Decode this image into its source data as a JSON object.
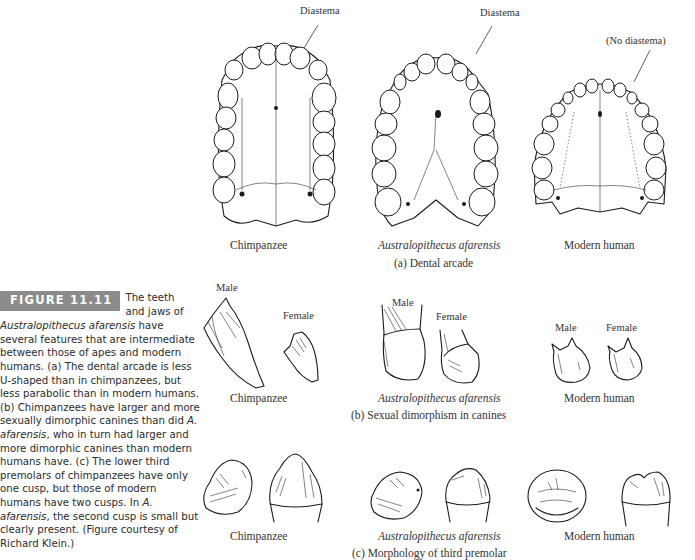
{
  "figure": {
    "badge": "FIGURE 11.11",
    "caption_lead_1": "The teeth",
    "caption_lead_2": "and jaws of",
    "caption_italic_1": "Australopithecus afarensis",
    "caption_text_1": " have several features that are intermediate between those of apes and modern humans. (a) The dental arcade is less U-shaped than in chimpanzees, but less parabolic than in modern humans. (b) Chimpanzees have larger and more sexually dimorphic canines than did ",
    "caption_italic_2": "A. afarensis",
    "caption_text_2": ", who in turn had larger and more dimorphic canines than modern humans have. (c) The lower third premolars of chimpanzees have only one cusp, but those of modern humans have two cusps. In ",
    "caption_italic_3": "A. afarensis",
    "caption_text_3": ", the second cusp is small but clearly present. (Figure courtesy of Richard Klein.)",
    "badge_color": "#8b8b8b"
  },
  "panel_a": {
    "title": "(a) Dental arcade",
    "species": [
      "Chimpanzee",
      "Australopithecus afarensis",
      "Modern human"
    ],
    "annotations": [
      "Diastema",
      "Diastema",
      "(No diastema)"
    ]
  },
  "panel_b": {
    "title": "(b) Sexual dimorphism in canines",
    "species": [
      "Chimpanzee",
      "Australopithecus afarensis",
      "Modern human"
    ],
    "sex_labels": {
      "chimp_male": "Male",
      "chimp_female": "Female",
      "afarensis_male": "Male",
      "afarensis_female": "Female",
      "human_male": "Male",
      "human_female": "Female"
    }
  },
  "panel_c": {
    "title": "(c) Morphology of third premolar",
    "species": [
      "Chimpanzee",
      "Australopithecus afarensis",
      "Modern human"
    ]
  }
}
